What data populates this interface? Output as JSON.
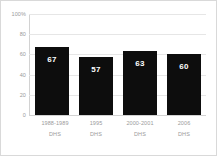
{
  "chart_data": {
    "type": "bar",
    "title": "",
    "subtitle": "",
    "xlabel": "",
    "ylabel": "",
    "categories": [
      "1988-1989\nDHS",
      "1995\nDHS",
      "2000-2001\nDHS",
      "2006\nDHS"
    ],
    "category_lines": [
      {
        "line1": "1988-1989",
        "line2": "DHS"
      },
      {
        "line1": "1995",
        "line2": "DHS"
      },
      {
        "line1": "2000-2001",
        "line2": "DHS"
      },
      {
        "line1": "2006",
        "line2": "DHS"
      }
    ],
    "values": [
      67,
      57,
      63,
      60
    ],
    "value_labels": [
      "67",
      "57",
      "63",
      "60"
    ],
    "ylim": [
      0,
      100
    ],
    "yticks": [
      0,
      20,
      40,
      60,
      80,
      100
    ],
    "ytick_labels": [
      "0",
      "20",
      "40",
      "60",
      "80",
      "100%"
    ],
    "grid": true,
    "legend": false,
    "legend_position": "none",
    "bar_color": "#0d0d0d",
    "value_label_color": "#ffffff",
    "gridline_color": "#e6e6e6",
    "axis_color": "#d2d2d2",
    "tick_label_color": "#9a9a9a",
    "background_color": "#ffffff",
    "border_color": "#d9d9d9"
  }
}
